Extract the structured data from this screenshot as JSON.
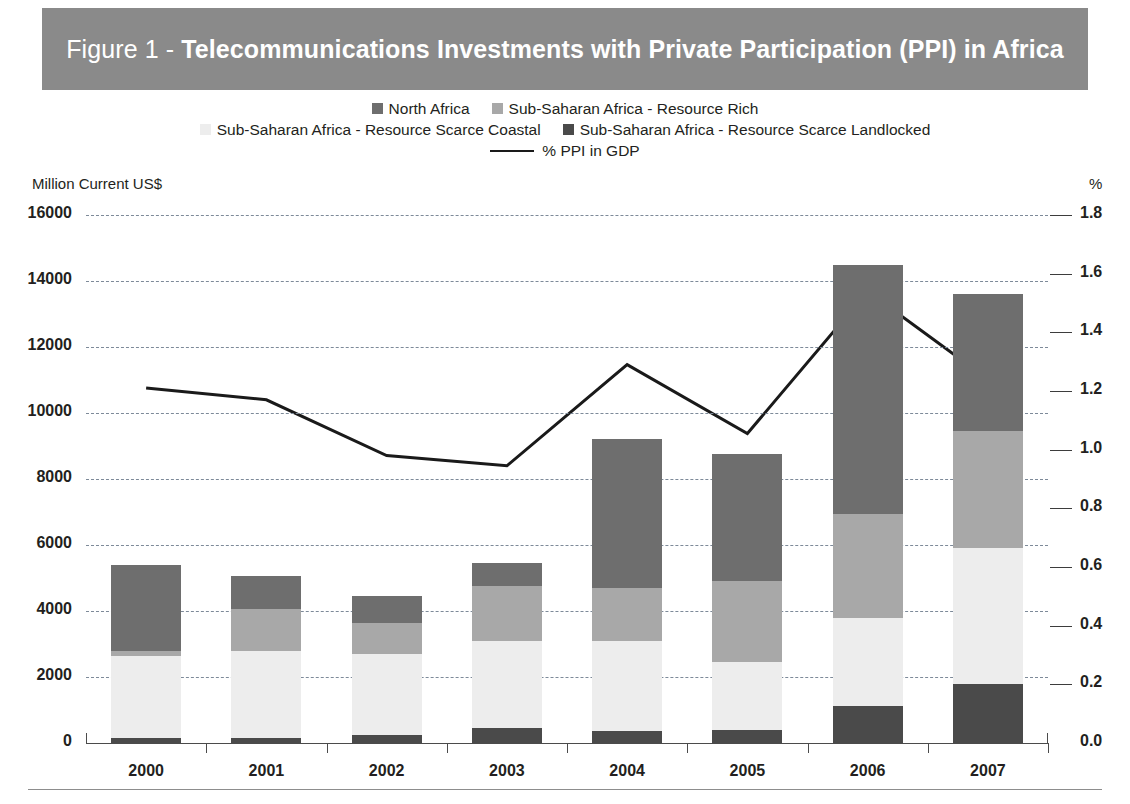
{
  "title": {
    "prefix": "Figure 1 - ",
    "main": "Telecommunications Investments with Private Participation (PPI) in Africa",
    "banner_color": "#8a8a8a",
    "text_color": "#ffffff"
  },
  "axes": {
    "left_unit": "Million Current US$",
    "right_unit": "%",
    "left_ticks": [
      "0",
      "2000",
      "4000",
      "6000",
      "8000",
      "10000",
      "12000",
      "14000",
      "16000"
    ],
    "right_ticks": [
      "0.0",
      "0.2",
      "0.4",
      "0.6",
      "0.8",
      "1.0",
      "1.2",
      "1.4",
      "1.6",
      "1.8"
    ]
  },
  "legend": {
    "rows": [
      [
        {
          "label": "North Africa",
          "color": "#6e6e6e",
          "type": "swatch"
        },
        {
          "label": "Sub-Saharan Africa - Resource Rich",
          "color": "#a8a8a8",
          "type": "swatch"
        }
      ],
      [
        {
          "label": "Sub-Saharan Africa - Resource Scarce Coastal",
          "color": "#ededed",
          "type": "swatch"
        },
        {
          "label": "Sub-Saharan Africa - Resource Scarce Landlocked",
          "color": "#4a4a4a",
          "type": "swatch"
        }
      ],
      [
        {
          "label": "% PPI in GDP",
          "color": "#1a1a1a",
          "type": "line"
        }
      ]
    ]
  },
  "chart_data": {
    "type": "bar",
    "subtype": "stacked-bar-with-line",
    "title": "Figure 1 - Telecommunications Investments with Private Participation (PPI) in Africa",
    "xlabel": "",
    "ylabel": "Million Current US$",
    "y2label": "%",
    "ylim": [
      0,
      16000
    ],
    "y2lim": [
      0.0,
      1.8
    ],
    "grid": true,
    "legend_position": "top",
    "categories": [
      "2000",
      "2001",
      "2002",
      "2003",
      "2004",
      "2005",
      "2006",
      "2007"
    ],
    "series": [
      {
        "name": "Sub-Saharan Africa - Resource Scarce Landlocked",
        "color": "#4a4a4a",
        "stack_order": 1,
        "values": [
          150,
          150,
          250,
          450,
          350,
          380,
          1120,
          1800
        ]
      },
      {
        "name": "Sub-Saharan Africa - Resource Scarce Coastal",
        "color": "#ededed",
        "stack_order": 2,
        "values": [
          2500,
          2650,
          2450,
          2650,
          2750,
          2070,
          2680,
          4100
        ]
      },
      {
        "name": "Sub-Saharan Africa - Resource Rich",
        "color": "#a8a8a8",
        "stack_order": 3,
        "values": [
          150,
          1250,
          950,
          1650,
          1600,
          2450,
          3150,
          3550
        ]
      },
      {
        "name": "North Africa",
        "color": "#6e6e6e",
        "stack_order": 4,
        "values": [
          2600,
          1000,
          800,
          700,
          4500,
          3850,
          7550,
          4150
        ]
      }
    ],
    "cumulative_tops": {
      "2000": [
        150,
        2650,
        2800,
        5400
      ],
      "2001": [
        150,
        2800,
        4050,
        5050
      ],
      "2002": [
        250,
        2700,
        3650,
        4450
      ],
      "2003": [
        450,
        3100,
        4750,
        5450
      ],
      "2004": [
        350,
        3100,
        4700,
        9200
      ],
      "2005": [
        380,
        2450,
        4900,
        8750
      ],
      "2006": [
        1120,
        3800,
        6950,
        14500
      ],
      "2007": [
        1800,
        5900,
        9450,
        13600
      ]
    },
    "line_series": {
      "name": "% PPI in GDP",
      "color": "#1a1a1a",
      "axis": "right",
      "values": [
        1.21,
        1.17,
        0.98,
        0.945,
        1.29,
        1.055,
        1.54,
        1.24
      ]
    }
  }
}
